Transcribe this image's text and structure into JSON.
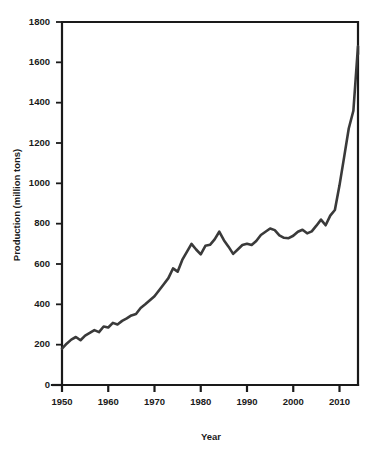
{
  "chart_data": {
    "type": "line",
    "title": "",
    "xlabel": "Year",
    "ylabel": "Production (million tons)",
    "xlim": [
      1950,
      2014
    ],
    "ylim": [
      0,
      1800
    ],
    "grid": false,
    "legend": null,
    "xticks": [
      1950,
      1960,
      1970,
      1980,
      1990,
      2000,
      2010
    ],
    "xtick_labels": [
      "1950",
      "1960",
      "1970",
      "1980",
      "1990",
      "2000",
      "2010"
    ],
    "yticks": [
      0,
      200,
      400,
      600,
      800,
      1000,
      1200,
      1400,
      1600,
      1800
    ],
    "ytick_labels": [
      "0",
      "200",
      "400",
      "600",
      "800",
      "1000",
      "1200",
      "1400",
      "1600",
      "1800"
    ],
    "line_color": "#3a3a3a",
    "axis_color": "#1a1a1a",
    "background_color": "#ffffff",
    "series": [
      {
        "name": "Production",
        "x": [
          1950,
          1951,
          1952,
          1953,
          1954,
          1955,
          1956,
          1957,
          1958,
          1959,
          1960,
          1961,
          1962,
          1963,
          1964,
          1965,
          1966,
          1967,
          1968,
          1969,
          1970,
          1971,
          1972,
          1973,
          1974,
          1975,
          1976,
          1977,
          1978,
          1979,
          1980,
          1981,
          1982,
          1983,
          1984,
          1985,
          1986,
          1987,
          1988,
          1989,
          1990,
          1991,
          1992,
          1993,
          1994,
          1995,
          1996,
          1997,
          1998,
          1999,
          2000,
          2001,
          2002,
          2003,
          2004,
          2005,
          2006,
          2007,
          2008,
          2009,
          2010,
          2011,
          2012,
          2013,
          2014
        ],
        "values": [
          180,
          205,
          225,
          238,
          222,
          245,
          258,
          272,
          262,
          290,
          285,
          308,
          300,
          318,
          330,
          345,
          352,
          382,
          400,
          420,
          440,
          470,
          500,
          530,
          578,
          562,
          620,
          660,
          700,
          672,
          648,
          690,
          695,
          722,
          760,
          718,
          686,
          650,
          672,
          694,
          700,
          694,
          714,
          744,
          760,
          776,
          768,
          742,
          730,
          728,
          740,
          760,
          770,
          752,
          762,
          790,
          820,
          792,
          840,
          868,
          990,
          1130,
          1272,
          1360,
          1680
        ]
      }
    ],
    "annotations": [
      {
        "label": "2008 peak",
        "year": 2008,
        "value": 1360
      },
      {
        "label": "2009 dip",
        "year": 2009,
        "value": 1230
      },
      {
        "label": "2014 peak",
        "year": 2013,
        "value": 1680
      },
      {
        "label": "end value",
        "year": 2014,
        "value": 1640
      }
    ]
  },
  "axes": {
    "x_title": "Year",
    "y_title": "Production (million tons)"
  }
}
